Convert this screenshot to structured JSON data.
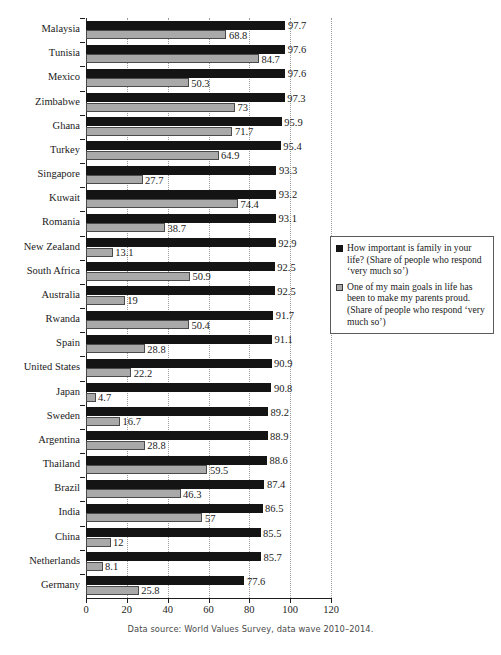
{
  "chart_data": {
    "type": "bar",
    "orientation": "horizontal",
    "title": "",
    "xlabel": "",
    "ylabel": "",
    "xlim": [
      0,
      120
    ],
    "xticks": [
      0,
      20,
      40,
      60,
      80,
      100,
      120
    ],
    "grid": true,
    "grid_axis": "x",
    "legend_position": "right",
    "categories": [
      "Malaysia",
      "Tunisia",
      "Mexico",
      "Zimbabwe",
      "Ghana",
      "Turkey",
      "Singapore",
      "Kuwait",
      "Romania",
      "New Zealand",
      "South Africa",
      "Australia",
      "Rwanda",
      "Spain",
      "United States",
      "Japan",
      "Sweden",
      "Argentina",
      "Thailand",
      "Brazil",
      "India",
      "China",
      "Netherlands",
      "Germany"
    ],
    "series": [
      {
        "name": "How important is family in your life? (Share of people who respond 'very much so')",
        "color": "#141414",
        "values": [
          97.7,
          97.6,
          97.6,
          97.3,
          95.9,
          95.4,
          93.3,
          93.2,
          93.1,
          92.9,
          92.5,
          92.5,
          91.7,
          91.1,
          90.9,
          90.8,
          89.2,
          88.9,
          88.6,
          87.4,
          86.5,
          85.5,
          85.7,
          77.6
        ],
        "labels": [
          "97.7",
          "97.6",
          "97.6",
          "97.3",
          "95.9",
          "95.4",
          "93.3",
          "93.2",
          "93.1",
          "92.9",
          "92.5",
          "92.5",
          "91.7",
          "91.1",
          "90.9",
          "90.8",
          "89.2",
          "88.9",
          "88.6",
          "87.4",
          "86.5",
          "85.5",
          "85.7",
          "77.6"
        ]
      },
      {
        "name": "One of my main goals in life has been to make my parents proud. (Share of people who respond 'very much so')",
        "color": "#a9a9a9",
        "values": [
          68.8,
          84.7,
          50.3,
          73,
          71.7,
          64.9,
          27.7,
          74.4,
          38.7,
          13.1,
          50.9,
          19,
          50.4,
          28.8,
          22.2,
          4.7,
          16.7,
          28.8,
          59.5,
          46.3,
          57,
          12,
          8.1,
          25.8
        ],
        "labels": [
          "68.8",
          "84.7",
          "50.3",
          "73",
          "71.7",
          "64.9",
          "27.7",
          "74.4",
          "38.7",
          "13.1",
          "50.9",
          "19",
          "50.4",
          "28.8",
          "22.2",
          "4.7",
          "16.7",
          "28.8",
          "59.5",
          "46.3",
          "57",
          "12",
          "8.1",
          "25.8"
        ]
      }
    ]
  },
  "legend": {
    "entries": [
      {
        "swatch": "black-square",
        "text": "How important is family in your life? (Share of people who respond ‘very much so’)"
      },
      {
        "swatch": "gray-square",
        "text": "One of my main goals in life has been to make my parents proud. (Share of people who respond ‘very much so’)"
      }
    ]
  },
  "footer": {
    "source": "Data source: World Values Survey, data wave 2010–2014."
  }
}
